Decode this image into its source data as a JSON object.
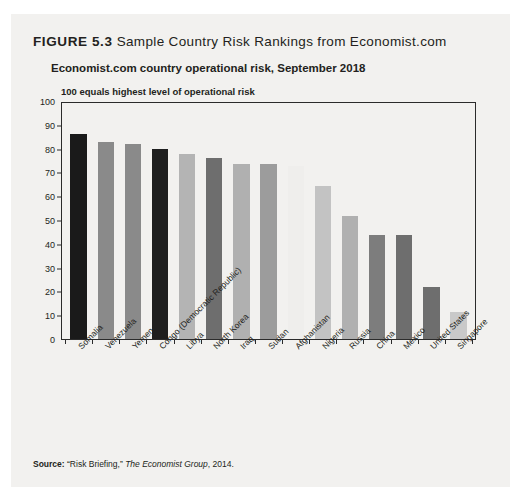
{
  "figure": {
    "number": "FIGURE 5.3",
    "caption": "Sample Country Risk Rankings from Economist.com"
  },
  "source": {
    "label": "Source:",
    "quoted": "“Risk Briefing,”",
    "publisher": "The Economist Group",
    "year": ", 2014."
  },
  "chart_data": {
    "type": "bar",
    "title": "Economist.com country operational risk, September 2018",
    "subtitle": "100 equals highest level of operational risk",
    "xlabel": "",
    "ylabel": "",
    "ylim": [
      0,
      100
    ],
    "yticks": [
      0,
      10,
      20,
      30,
      40,
      50,
      60,
      70,
      80,
      90,
      100
    ],
    "grid": false,
    "legend": "none",
    "categories": [
      "Somalia",
      "Venezuela",
      "Yemen",
      "Congo (Democratic Republic)",
      "Libya",
      "North Korea",
      "Iraq",
      "Sudan",
      "Afghanistan",
      "Nigeria",
      "Russia",
      "China",
      "Mexico",
      "United States",
      "Singapore"
    ],
    "values": [
      87,
      83.5,
      82.5,
      80.5,
      78.5,
      76.5,
      74,
      74,
      73.5,
      65,
      52,
      44,
      44,
      22,
      11.5
    ],
    "bar_colors": [
      "#1a1a1a",
      "#8a8a8a",
      "#8a8a8a",
      "#1f1f1f",
      "#b4b4b4",
      "#6e6e6e",
      "#b0b0b0",
      "#9c9c9c",
      "#efeeec",
      "#c3c3c3",
      "#b0b0b0",
      "#7d7d7d",
      "#6e6e6e",
      "#6e6e6e",
      "#c9c9c9"
    ]
  }
}
